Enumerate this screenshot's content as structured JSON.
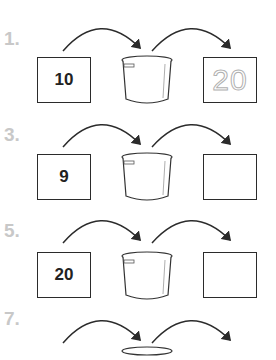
{
  "worksheet": {
    "problems": [
      {
        "label": "1.",
        "input": "10",
        "output": "20",
        "output_traced": true
      },
      {
        "label": "3.",
        "input": "9",
        "output": "",
        "output_traced": false
      },
      {
        "label": "5.",
        "input": "20",
        "output": "",
        "output_traced": false
      },
      {
        "label": "7.",
        "input": "",
        "output": "",
        "output_traced": false
      }
    ],
    "icons": {
      "machine": "cooking-pot-icon",
      "flow": "curved-arrow-icon"
    },
    "colors": {
      "label": "#c8c8c8",
      "line": "#2b2b2b",
      "traced": "#b0b0b0"
    }
  }
}
